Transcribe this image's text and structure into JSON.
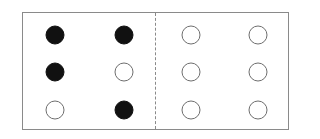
{
  "diagram": {
    "colors": {
      "filled": "#111111",
      "empty_stroke": "#6e6e6e",
      "frame": "#8a8a8a"
    },
    "left_panel": {
      "rows": [
        [
          "filled",
          "filled"
        ],
        [
          "filled",
          "empty"
        ],
        [
          "empty",
          "filled"
        ]
      ]
    },
    "right_panel": {
      "rows": [
        [
          "empty",
          "empty"
        ],
        [
          "empty",
          "empty"
        ],
        [
          "empty",
          "empty"
        ]
      ]
    }
  }
}
